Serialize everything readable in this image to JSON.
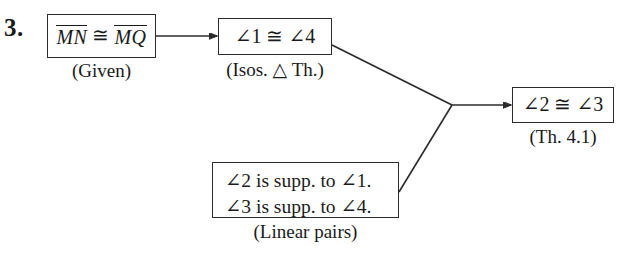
{
  "problem": {
    "number": "3."
  },
  "boxes": {
    "given": {
      "segment_1": "MN",
      "congruent_symbol": "≅",
      "segment_2": "MQ",
      "caption": "(Given)"
    },
    "isosceles": {
      "text": "∠1 ≅ ∠4",
      "caption": "(Isos. △ Th.)"
    },
    "linear_pairs": {
      "line_1": "∠2 is supp. to ∠1.",
      "line_2": "∠3 is supp. to ∠4.",
      "caption": "(Linear pairs)"
    },
    "conclusion": {
      "text": "∠2 ≅ ∠3",
      "caption": "(Th. 4.1)"
    }
  },
  "colors": {
    "ink": "#2b2b2b",
    "background": "#ffffff"
  }
}
